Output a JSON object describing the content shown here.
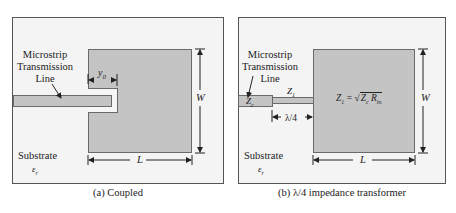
{
  "panels": [
    {
      "id": "a",
      "caption": "(a) Coupled",
      "labels": {
        "feed_line": [
          "Microstrip",
          "Transmission",
          "Line"
        ],
        "inset_depth": "y0",
        "inset_depth_base": "y",
        "inset_depth_sub": "0",
        "width": "W",
        "length": "L",
        "substrate": "Substrate",
        "permittivity": "εr",
        "permittivity_base": "ε",
        "permittivity_sub": "r"
      }
    },
    {
      "id": "b",
      "caption": "(b) λ/4 impedance transformer",
      "labels": {
        "feed_line": [
          "Microstrip",
          "Transmission",
          "Line"
        ],
        "z0": "Z0",
        "z0_base": "Z",
        "z0_sub": "c",
        "z1": "Z1",
        "z1_base": "Z",
        "z1_sub": "1",
        "quarter_wave": "λ/4",
        "formula_lhs_base": "Z",
        "formula_lhs_sub": "1",
        "formula_eq": "=",
        "formula_sqrt": "√",
        "formula_z_base": "Z",
        "formula_z_sub": "c",
        "formula_r_base": "R",
        "formula_r_sub": "in",
        "width": "W",
        "length": "L",
        "substrate": "Substrate",
        "permittivity_base": "ε",
        "permittivity_sub": "r"
      }
    }
  ],
  "colors": {
    "metal": "#c4c4c4",
    "substrate": "#f4f4f4",
    "outline": "#555555"
  }
}
